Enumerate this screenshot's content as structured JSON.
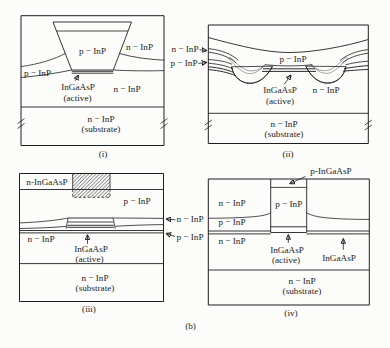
{
  "figure": {
    "caption": "(b)",
    "panels": {
      "i": {
        "caption": "(i)",
        "mesa_label": "p − InP",
        "right_of_mesa_label": "n − InP",
        "left_band_label": "p − InP",
        "active_label": "InGaAsP",
        "active_sub_label": "(active)",
        "lower_right_label": "n − InP",
        "substrate_label": "n − InP",
        "substrate_sub_label": "(substrate)"
      },
      "ii": {
        "caption": "(ii)",
        "left_outer_top_label": "n − InP",
        "left_outer_bottom_label": "p − InP",
        "top_region_label": "p − InP",
        "active_label": "InGaAsP",
        "active_sub_label": "(active)",
        "right_lower_label": "n − InP",
        "substrate_label": "n − InP",
        "substrate_sub_label": "(substrate)"
      },
      "iii": {
        "caption": "(iii)",
        "cap_layer_label": "n-InGaAsP",
        "upper_region_label": "p − InP",
        "left_region_label": "n − InP",
        "active_label": "InGaAsP",
        "active_sub_label": "(active)",
        "right_outer_top_label": "n − InP",
        "right_outer_bottom_label": "p − InP",
        "substrate_label": "n − InP",
        "substrate_sub_label": "(substrate)"
      },
      "iv": {
        "caption": "(iv)",
        "top_outer_label": "p-InGaAsP",
        "left_stack_top_label": "n − InP",
        "left_stack_mid_label": "p − InP",
        "left_stack_bottom_label": "n − InP",
        "column_label": "p − InP",
        "active_label": "InGaAsP",
        "active_sub_label": "(active)",
        "right_layer_label": "InGaAsP",
        "substrate_label": "n − InP",
        "substrate_sub_label": "(substrate)"
      }
    }
  }
}
